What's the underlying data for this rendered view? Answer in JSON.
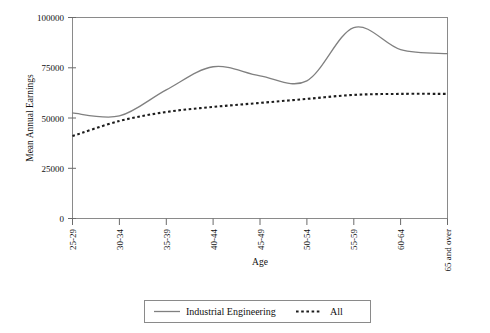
{
  "chart_data": {
    "type": "line",
    "title": "",
    "xlabel": "Age",
    "ylabel": "Mean Annual Earnings",
    "categories": [
      "25-29",
      "30-34",
      "35-39",
      "40-44",
      "45-49",
      "50-54",
      "55-59",
      "60-64",
      "65 and over"
    ],
    "ylim": [
      0,
      100000
    ],
    "yticks": [
      0,
      25000,
      50000,
      75000,
      100000
    ],
    "ytick_labels": [
      "0",
      "25000",
      "50000",
      "75000",
      "100000"
    ],
    "grid": false,
    "legend_position": "bottom",
    "series": [
      {
        "name": "Industrial Engineering",
        "style": "solid",
        "color": "#808080",
        "values": [
          52500,
          51000,
          64000,
          75500,
          71000,
          68500,
          95000,
          84000,
          82000
        ]
      },
      {
        "name": "All",
        "style": "dotted",
        "color": "#1c1c1c",
        "values": [
          41000,
          48500,
          53000,
          55500,
          57500,
          59500,
          61500,
          62000,
          62000
        ]
      }
    ]
  },
  "axes": {
    "y_title": "Mean Annual Earnings",
    "x_title": "Age",
    "y_tick_labels": [
      "100000",
      "75000",
      "50000",
      "25000",
      "0"
    ],
    "x_tick_labels": [
      "25-29",
      "30-34",
      "35-39",
      "40-44",
      "45-49",
      "50-54",
      "55-59",
      "60-64",
      "65 and over"
    ]
  },
  "legend": {
    "items": [
      {
        "label": "Industrial Engineering",
        "style": "solid"
      },
      {
        "label": "All",
        "style": "dotted"
      }
    ]
  }
}
